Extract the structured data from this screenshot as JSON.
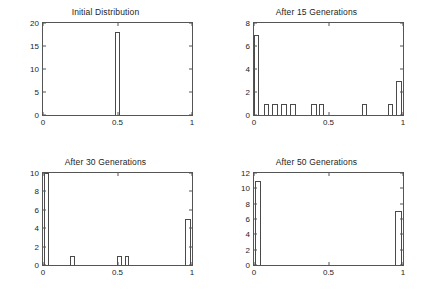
{
  "figure": {
    "background": "#ffffff",
    "axis_color": "#555555",
    "bar_edge_color": "#4a4a4a",
    "bar_fill_color": "#ffffff",
    "text_color": "#1d1d1d"
  },
  "chart_data": [
    {
      "type": "bar",
      "title": "Initial Distribution",
      "xlabel": "",
      "ylabel": "",
      "xlim": [
        0,
        1
      ],
      "ylim": [
        0,
        20
      ],
      "xticks": [
        0,
        0.5,
        1
      ],
      "xticklabels": [
        "0",
        "0.5",
        "1"
      ],
      "yticks": [
        0,
        5,
        10,
        15,
        20
      ],
      "yticklabels": [
        "0",
        "5",
        "10",
        "15",
        "20"
      ],
      "grid": false,
      "legend": null,
      "bars": [
        {
          "x": 0.5,
          "width": 0.028,
          "value": 18
        }
      ]
    },
    {
      "type": "bar",
      "title": "After 15 Generations",
      "xlabel": "",
      "ylabel": "",
      "xlim": [
        0,
        1
      ],
      "ylim": [
        0,
        8
      ],
      "xticks": [
        0,
        0.5,
        1
      ],
      "xticklabels": [
        "0",
        "0.5",
        "1"
      ],
      "yticks": [
        0,
        2,
        4,
        6,
        8
      ],
      "yticklabels": [
        "0",
        "2",
        "4",
        "6",
        "8"
      ],
      "grid": false,
      "legend": null,
      "bars": [
        {
          "x": 0.018,
          "width": 0.036,
          "value": 7
        },
        {
          "x": 0.082,
          "width": 0.036,
          "value": 1
        },
        {
          "x": 0.142,
          "width": 0.036,
          "value": 1
        },
        {
          "x": 0.202,
          "width": 0.036,
          "value": 1
        },
        {
          "x": 0.262,
          "width": 0.036,
          "value": 1
        },
        {
          "x": 0.402,
          "width": 0.036,
          "value": 1
        },
        {
          "x": 0.455,
          "width": 0.036,
          "value": 1
        },
        {
          "x": 0.742,
          "width": 0.036,
          "value": 1
        },
        {
          "x": 0.918,
          "width": 0.036,
          "value": 1
        },
        {
          "x": 0.972,
          "width": 0.036,
          "value": 3
        }
      ]
    },
    {
      "type": "bar",
      "title": "After 30 Generations",
      "xlabel": "",
      "ylabel": "",
      "xlim": [
        0,
        1
      ],
      "ylim": [
        0,
        10
      ],
      "xticks": [
        0,
        0.5,
        1
      ],
      "xticklabels": [
        "0",
        "0.5",
        "1"
      ],
      "yticks": [
        0,
        2,
        4,
        6,
        8,
        10
      ],
      "yticklabels": [
        "0",
        "2",
        "4",
        "6",
        "8",
        "10"
      ],
      "grid": false,
      "legend": null,
      "bars": [
        {
          "x": 0.022,
          "width": 0.03,
          "value": 10
        },
        {
          "x": 0.2,
          "width": 0.036,
          "value": 1
        },
        {
          "x": 0.512,
          "width": 0.03,
          "value": 1
        },
        {
          "x": 0.565,
          "width": 0.03,
          "value": 1
        },
        {
          "x": 0.972,
          "width": 0.044,
          "value": 5
        }
      ]
    },
    {
      "type": "bar",
      "title": "After 50 Generations",
      "xlabel": "",
      "ylabel": "",
      "xlim": [
        0,
        1
      ],
      "ylim": [
        0,
        12
      ],
      "xticks": [
        0,
        0.5,
        1
      ],
      "xticklabels": [
        "0",
        "0.5",
        "1"
      ],
      "yticks": [
        0,
        2,
        4,
        6,
        8,
        10,
        12
      ],
      "yticklabels": [
        "0",
        "2",
        "4",
        "6",
        "8",
        "10",
        "12"
      ],
      "grid": false,
      "legend": null,
      "bars": [
        {
          "x": 0.026,
          "width": 0.044,
          "value": 11
        },
        {
          "x": 0.968,
          "width": 0.044,
          "value": 7
        }
      ]
    }
  ]
}
